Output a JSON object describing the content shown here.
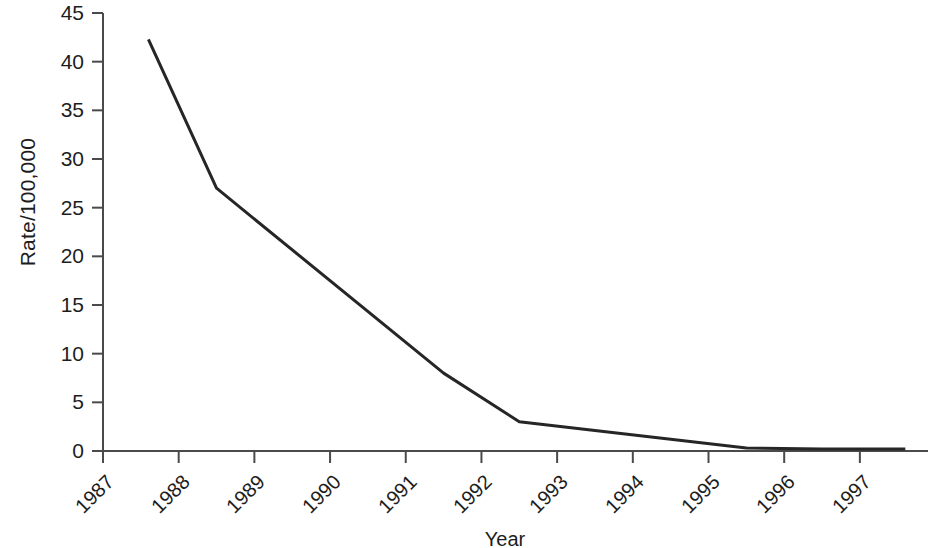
{
  "chart_data": {
    "type": "line",
    "title": "",
    "xlabel": "Year",
    "ylabel": "Rate/100,000",
    "xlim": [
      1987,
      1997.9
    ],
    "ylim": [
      0,
      45
    ],
    "grid": false,
    "legend": null,
    "x_tick_labels": [
      "1987",
      "1988",
      "1989",
      "1990",
      "1991",
      "1992",
      "1993",
      "1994",
      "1995",
      "1996",
      "1997"
    ],
    "x_ticks": [
      1987,
      1988,
      1989,
      1990,
      1991,
      1992,
      1993,
      1994,
      1995,
      1996,
      1997
    ],
    "y_tick_labels": [
      "0",
      "5",
      "10",
      "15",
      "20",
      "25",
      "30",
      "35",
      "40",
      "45"
    ],
    "y_ticks": [
      0,
      5,
      10,
      15,
      20,
      25,
      30,
      35,
      40,
      45
    ],
    "series": [
      {
        "name": "Rate",
        "color": "#262626",
        "line_width": 3,
        "x": [
          1987.6,
          1988.5,
          1991.5,
          1992.5,
          1993.5,
          1994.5,
          1995.5,
          1996.5,
          1997.6
        ],
        "values": [
          42.3,
          27.0,
          8.0,
          3.0,
          2.1,
          1.2,
          0.3,
          0.2,
          0.2
        ]
      }
    ]
  },
  "axes": {
    "y_label": "Rate/100,000",
    "x_label": "Year"
  },
  "colors": {
    "line": "#262626",
    "axis": "#4a4a4a",
    "background": "#ffffff",
    "text": "#1d1d1d"
  }
}
